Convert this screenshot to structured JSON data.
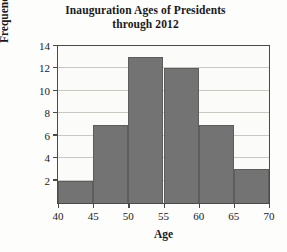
{
  "chart_data": {
    "type": "bar",
    "title": "Inauguration Ages of Presidents through 2012",
    "title_lines": [
      "Inauguration Ages of Presidents",
      "through 2012"
    ],
    "xlabel": "Age",
    "ylabel": "Frequency",
    "categories": [
      "40-45",
      "45-50",
      "50-55",
      "55-60",
      "60-65",
      "65-70"
    ],
    "bin_edges": [
      40,
      45,
      50,
      55,
      60,
      65,
      70
    ],
    "values": [
      2,
      7,
      13,
      12,
      7,
      3
    ],
    "xlim": [
      40,
      70
    ],
    "ylim": [
      0,
      14
    ],
    "xticks": [
      40,
      45,
      50,
      55,
      60,
      65,
      70
    ],
    "yticks": [
      2,
      4,
      6,
      8,
      10,
      12,
      14
    ],
    "grid": "horizontal",
    "legend": "none",
    "bar_color": "#737373",
    "bar_edge_color": "#5d5d5d",
    "frame_color": "#4a4a4a",
    "grid_color": "#c9c9c4",
    "background_color": "#fdfdfb"
  }
}
